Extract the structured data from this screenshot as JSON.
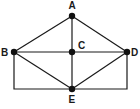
{
  "diagram": {
    "type": "graph",
    "nodes": [
      {
        "id": "A",
        "label": "A"
      },
      {
        "id": "B",
        "label": "B"
      },
      {
        "id": "C",
        "label": "C"
      },
      {
        "id": "D",
        "label": "D"
      },
      {
        "id": "E",
        "label": "E"
      }
    ],
    "edges": [
      {
        "from": "A",
        "to": "B"
      },
      {
        "from": "A",
        "to": "D"
      },
      {
        "from": "A",
        "to": "C"
      },
      {
        "from": "C",
        "to": "E"
      },
      {
        "from": "B",
        "to": "C"
      },
      {
        "from": "C",
        "to": "D"
      },
      {
        "from": "B",
        "to": "E"
      },
      {
        "from": "D",
        "to": "E"
      },
      {
        "from": "B",
        "to": "E",
        "route": "via-bottom-left-corner"
      },
      {
        "from": "D",
        "to": "E",
        "route": "via-bottom-right-corner"
      }
    ],
    "colors": {
      "stroke": "#1a1a1a",
      "node": "#111111",
      "background": "#ffffff"
    }
  }
}
